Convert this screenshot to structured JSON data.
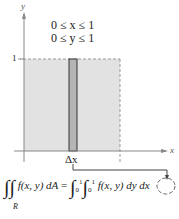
{
  "figure": {
    "region_label": "R",
    "constraints": [
      "0 ≤ x ≤ 1",
      "0 ≤ y ≤ 1"
    ],
    "axes": {
      "x_label": "x",
      "y_label": "y"
    },
    "ticks": {
      "y_tick": "1",
      "x_tick": "1"
    },
    "strip_label": "Δx",
    "colors": {
      "region_fill": "#e2e2e2",
      "strip_fill": "#b5b5b5",
      "axis": "#888888",
      "dash": "#999999"
    }
  },
  "formula": {
    "lhs_integrand": "f(x, y) dA",
    "equals": "=",
    "outer_limits": {
      "lower": "0",
      "upper": "1"
    },
    "inner_limits": {
      "lower": "0",
      "upper": "1"
    },
    "rhs_integrand": "f(x, y) dy",
    "circled_differential": "dx"
  }
}
